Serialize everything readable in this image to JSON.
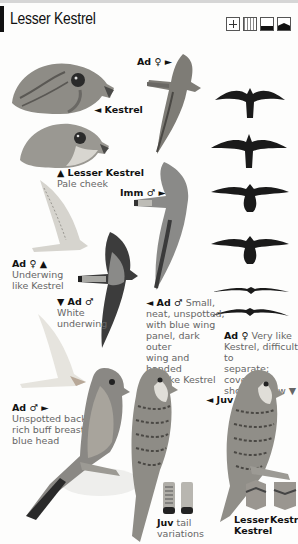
{
  "header": {
    "title": "Lesser Kestrel",
    "habitat_icons": [
      "crosshair-icon",
      "reeds-icon",
      "flat-ground-icon",
      "hill-icon"
    ]
  },
  "labels": {
    "kestrel_head": "◄ Kestrel",
    "lesser_head_title": "▲ Lesser Kestrel",
    "lesser_head_desc": "Pale cheek",
    "ad_female_top": "Ad ♀ ►",
    "imm_male": "Imm ♂ ►",
    "ad_female_under_title": "Ad ♀ ▲",
    "ad_female_under_desc1": "Underwing",
    "ad_female_under_desc2": "like Kestrel",
    "ad_male_under_title": "▼ Ad ♂",
    "ad_male_under_desc1": "White",
    "ad_male_under_desc2": "underwing",
    "ad_male_upper_title": "◄ Ad ♂",
    "ad_male_upper_desc": [
      "Small,",
      "neat, unspotted,",
      "with blue wing",
      "panel, dark outer",
      "wing and banded",
      "tail like Kestrel"
    ],
    "ad_female_note_title": "Ad ♀",
    "ad_female_note_desc": [
      "Very like",
      "Kestrel, difficult to",
      "separate; coverts",
      "shown below ▼"
    ],
    "ad_male_perched_title": "Ad ♂ ►",
    "ad_male_perched_desc": [
      "Unspotted back,",
      "rich buff breast,",
      "blue head"
    ],
    "juv": "◄ Juv",
    "juv_tail_title": "Juv",
    "juv_tail_desc1": "tail",
    "juv_tail_desc2": "variations",
    "coverts_lesser1": "Lesser",
    "coverts_lesser2": "Kestrel",
    "coverts_kestrel": "Kestrel"
  },
  "colors": {
    "silhouette": "#1a1a1a",
    "plumage_grey": "#8a8a88",
    "plumage_dark": "#3c3c3c",
    "text_desc": "#666666"
  }
}
